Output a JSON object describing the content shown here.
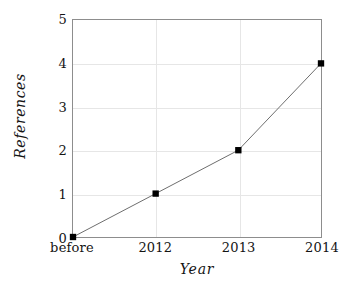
{
  "chart_data": {
    "type": "line",
    "title": "",
    "subtitle": "",
    "xlabel": "Year",
    "ylabel": "References",
    "categories": [
      "before",
      "2012",
      "2013",
      "2014"
    ],
    "values": [
      0,
      1,
      2,
      4
    ],
    "series": [
      {
        "name": "References",
        "values": [
          0,
          1,
          2,
          4
        ]
      }
    ],
    "ylim": [
      0,
      5
    ],
    "yticks": [
      0,
      1,
      2,
      3,
      4,
      5
    ],
    "ytick_labels": [
      "0",
      "1",
      "2",
      "3",
      "4",
      "5"
    ],
    "xticks": [
      "before",
      "2012",
      "2013",
      "2014"
    ],
    "grid": true,
    "grid_color": "#e6e6e6",
    "legend": false,
    "legend_position": "none",
    "marker": "filled-square",
    "marker_color": "#000000",
    "line_color": "#6e6e6e",
    "frame_color": "#8d8d8d",
    "background_color": "#ffffff",
    "annotations": []
  },
  "axes": {
    "y": {
      "label": "References",
      "ticks": [
        {
          "value": 5,
          "text": "5"
        },
        {
          "value": 4,
          "text": "4"
        },
        {
          "value": 3,
          "text": "3"
        },
        {
          "value": 2,
          "text": "2"
        },
        {
          "value": 1,
          "text": "1"
        },
        {
          "value": 0,
          "text": "0"
        }
      ]
    },
    "x": {
      "label": "Year",
      "ticks": [
        {
          "text": "before"
        },
        {
          "text": "2012"
        },
        {
          "text": "2013"
        },
        {
          "text": "2014"
        }
      ]
    }
  }
}
